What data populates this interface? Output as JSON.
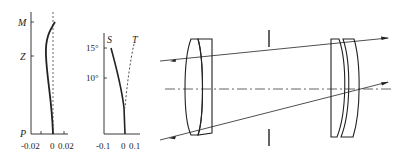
{
  "plot1": {
    "title": "distortion curve",
    "y_labels": [
      "M",
      "Z",
      "P"
    ],
    "x_ticks": [
      "-0.02",
      "0",
      "0.02"
    ]
  },
  "plot2": {
    "title": "astigmatism field curves",
    "y_ticks": [
      "15°",
      "10°"
    ],
    "series": [
      "S",
      "T"
    ],
    "x_ticks": [
      "-0.1",
      "0",
      "0.1"
    ]
  },
  "layout": {
    "description": "lens system optical layout with front doublet, aperture stop, rear meniscus pair, and traced rays"
  },
  "colors": {
    "ink": "#222222",
    "background": "#ffffff"
  }
}
